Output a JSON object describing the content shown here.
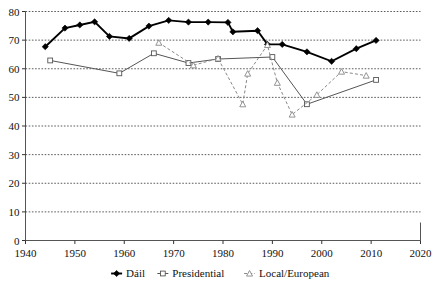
{
  "chart_data": {
    "type": "line",
    "title": "",
    "subtitle": "",
    "xlabel": "",
    "ylabel": "",
    "xlim": [
      1940,
      2020
    ],
    "ylim": [
      0,
      80
    ],
    "xticks": [
      1940,
      1950,
      1960,
      1970,
      1980,
      1990,
      2000,
      2010,
      2020
    ],
    "yticks": [
      0,
      10,
      20,
      30,
      40,
      50,
      60,
      70,
      80
    ],
    "grid": "horizontal-dotted",
    "legend_position": "bottom",
    "series": [
      {
        "name": "Dáil",
        "color": "#000000",
        "marker": "filled-diamond",
        "linestyle": "solid",
        "points": [
          [
            1944,
            67.7
          ],
          [
            1948,
            74.2
          ],
          [
            1951,
            75.3
          ],
          [
            1954,
            76.4
          ],
          [
            1957,
            71.3
          ],
          [
            1961,
            70.6
          ],
          [
            1965,
            74.9
          ],
          [
            1969,
            76.9
          ],
          [
            1973,
            76.3
          ],
          [
            1977,
            76.3
          ],
          [
            1981,
            76.2
          ],
          [
            1982,
            72.9
          ],
          [
            1987,
            73.3
          ],
          [
            1989,
            68.5
          ],
          [
            1992,
            68.5
          ],
          [
            1997,
            65.9
          ],
          [
            2002,
            62.6
          ],
          [
            2007,
            67.0
          ],
          [
            2011,
            69.9
          ]
        ]
      },
      {
        "name": "Presidential",
        "color": "#555555",
        "marker": "open-square",
        "linestyle": "solid",
        "points": [
          [
            1945,
            62.9
          ],
          [
            1959,
            58.4
          ],
          [
            1966,
            65.4
          ],
          [
            1973,
            62.0
          ],
          [
            1979,
            63.4
          ],
          [
            1990,
            64.1
          ],
          [
            1997,
            47.6
          ],
          [
            2011,
            56.1
          ]
        ]
      },
      {
        "name": "Local/European",
        "color": "#888888",
        "marker": "open-triangle",
        "linestyle": "dashed",
        "points": [
          [
            1967,
            69.1
          ],
          [
            1974,
            61.2
          ],
          [
            1979,
            63.6
          ],
          [
            1984,
            47.6
          ],
          [
            1985,
            58.3
          ],
          [
            1989,
            68.3
          ],
          [
            1991,
            55.1
          ],
          [
            1994,
            44.0
          ],
          [
            1999,
            50.9
          ],
          [
            2004,
            59.0
          ],
          [
            2009,
            57.6
          ]
        ]
      }
    ]
  },
  "legend": {
    "items": [
      {
        "label": "Dáil",
        "marker": "filled-diamond",
        "color": "#000000"
      },
      {
        "label": "Presidential",
        "marker": "open-square",
        "color": "#555555"
      },
      {
        "label": "Local/European",
        "marker": "open-triangle",
        "color": "#888888"
      }
    ]
  },
  "axes": {
    "x_tick_labels": [
      "1940",
      "1950",
      "1960",
      "1970",
      "1980",
      "1990",
      "2000",
      "2010",
      "2020"
    ],
    "y_tick_labels": [
      "0",
      "10",
      "20",
      "30",
      "40",
      "50",
      "60",
      "70",
      "80"
    ]
  }
}
